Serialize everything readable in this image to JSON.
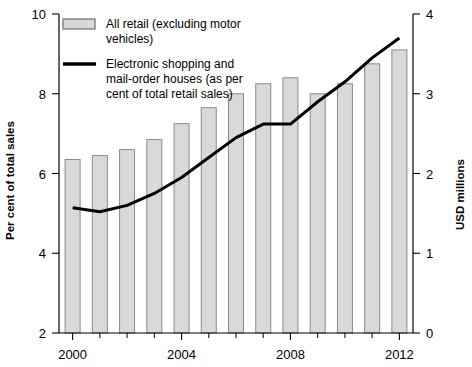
{
  "chart_data": {
    "type": "bar",
    "title": "",
    "subtitle": "",
    "xlabel": "",
    "ylabel": "Per cent of total sales",
    "y2label": "USD millions",
    "grid": false,
    "legend_position": "top-left",
    "categories": [
      "2000",
      "2001",
      "2002",
      "2003",
      "2004",
      "2005",
      "2006",
      "2007",
      "2008",
      "2009",
      "2010",
      "2011",
      "2012"
    ],
    "xlim": [
      1999.5,
      2012.5
    ],
    "x_tick_labels": [
      "2000",
      "2004",
      "2008",
      "2012"
    ],
    "x_tick_values": [
      2000,
      2004,
      2008,
      2012
    ],
    "x_minor_ticks": [
      2001,
      2002,
      2003,
      2005,
      2006,
      2007,
      2009,
      2010,
      2011
    ],
    "ylim": [
      2,
      10
    ],
    "y_ticks": [
      2,
      4,
      6,
      8,
      10
    ],
    "y_tick_labels": [
      "2",
      "4",
      "6",
      "8",
      "10"
    ],
    "y2lim": [
      0,
      4
    ],
    "y2_ticks": [
      0,
      1,
      2,
      3,
      4
    ],
    "y2_tick_labels": [
      "0",
      "1",
      "2",
      "3",
      "4"
    ],
    "series": [
      {
        "name": "All retail (excluding motor vehicles)",
        "type": "bar",
        "axis": "left",
        "unit": "per cent of total sales",
        "color": "#d9d9d9",
        "edge_color": "#8a8a8a",
        "values": [
          6.35,
          6.45,
          6.6,
          6.85,
          7.25,
          7.65,
          8.0,
          8.25,
          8.4,
          8.0,
          8.25,
          8.75,
          9.1
        ]
      },
      {
        "name": "Electronic shopping and mail-order houses (as per cent of total retail sales)",
        "type": "line",
        "axis": "right",
        "unit": "USD millions",
        "color": "#000000",
        "values": [
          1.57,
          1.52,
          1.6,
          1.75,
          1.95,
          2.2,
          2.45,
          2.62,
          2.62,
          2.9,
          3.15,
          3.45,
          3.7
        ]
      }
    ]
  },
  "legend": {
    "entries": [
      {
        "marker": "bar-swatch",
        "line1": "All retail (excluding motor",
        "line2": "vehicles)"
      },
      {
        "marker": "line-swatch",
        "line1": "Electronic shopping and",
        "line2": "mail-order houses (as per",
        "line3": "cent of total retail sales)"
      }
    ]
  },
  "axes": {
    "left_title": "Per cent of total sales",
    "right_title": "USD millions",
    "left_labels": [
      "10",
      "8",
      "6",
      "4",
      "2"
    ],
    "right_labels": [
      "4",
      "3",
      "2",
      "1",
      "0"
    ],
    "x_labels": [
      "2000",
      "2004",
      "2008",
      "2012"
    ]
  }
}
